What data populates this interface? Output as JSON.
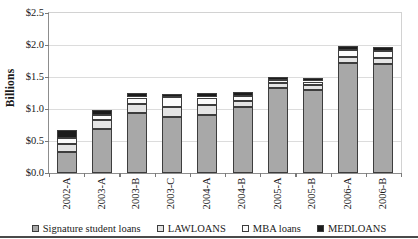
{
  "chart_data": {
    "type": "bar",
    "subtype": "stacked-bar",
    "title": "",
    "xlabel": "",
    "ylabel": "Billions",
    "ylim": [
      0.0,
      2.5
    ],
    "ytick_step": 0.5,
    "ytick_labels": [
      "$0.0",
      "$0.5",
      "$1.0",
      "$1.5",
      "$2.0",
      "$2.5"
    ],
    "ytick_values": [
      0.0,
      0.5,
      1.0,
      1.5,
      2.0,
      2.5
    ],
    "grid": true,
    "grid_axis": "y",
    "legend_position": "bottom",
    "categories": [
      "2002-A",
      "2003-A",
      "2003-B",
      "2003-C",
      "2004-A",
      "2004-B",
      "2005-A",
      "2005-B",
      "2006-A",
      "2006-B"
    ],
    "series": [
      {
        "name": "Signature student loans",
        "color": "#a8a8a8",
        "values": [
          0.33,
          0.68,
          0.93,
          0.88,
          0.9,
          1.03,
          1.33,
          1.3,
          1.72,
          1.7
        ]
      },
      {
        "name": "LAWLOANS",
        "color": "#e4e4e4",
        "values": [
          0.12,
          0.15,
          0.15,
          0.15,
          0.16,
          0.1,
          0.07,
          0.08,
          0.1,
          0.1
        ]
      },
      {
        "name": "MBA loans",
        "color": "#fbfbfb",
        "values": [
          0.1,
          0.07,
          0.1,
          0.16,
          0.12,
          0.07,
          0.05,
          0.05,
          0.1,
          0.1
        ]
      },
      {
        "name": "MEDLOANS",
        "color": "#1c1c1c",
        "values": [
          0.13,
          0.09,
          0.07,
          0.05,
          0.07,
          0.07,
          0.05,
          0.05,
          0.06,
          0.07
        ]
      }
    ],
    "totals": [
      0.68,
      0.99,
      1.25,
      1.24,
      1.25,
      1.27,
      1.5,
      1.48,
      1.98,
      1.97
    ]
  },
  "legend": {
    "entries": [
      {
        "label": "Signature student loans",
        "color": "#a8a8a8"
      },
      {
        "label": "LAWLOANS",
        "color": "#e4e4e4"
      },
      {
        "label": "MBA loans",
        "color": "#fbfbfb"
      },
      {
        "label": "MEDLOANS",
        "color": "#1c1c1c"
      }
    ]
  }
}
